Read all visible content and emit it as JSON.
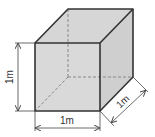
{
  "diagram": {
    "labels": {
      "height": "1m",
      "width": "1m",
      "depth": "1m"
    },
    "colors": {
      "face_fill": "#d9d9d9",
      "top_fill": "#d6d6d6",
      "side_fill": "#cfcfcf",
      "edge": "#333333",
      "hidden_edge": "#888888",
      "dimension": "#444444"
    }
  }
}
